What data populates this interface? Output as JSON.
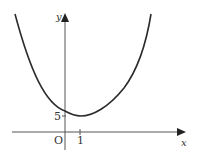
{
  "diagram": {
    "type": "parabola-graph",
    "axes": {
      "x_label": "x",
      "y_label": "y",
      "origin_label": "O"
    },
    "annotations": {
      "y_intercept_tick": "5",
      "x_vertex_tick": "1"
    },
    "curve": {
      "shape": "upward-opening parabola",
      "vertex": [
        1,
        5
      ],
      "description": "U-shaped curve with minimum point at x = 1, y-value near 5"
    },
    "colors": {
      "stroke": "#2b2b2b",
      "text": "#333333",
      "background": "#ffffff"
    }
  }
}
